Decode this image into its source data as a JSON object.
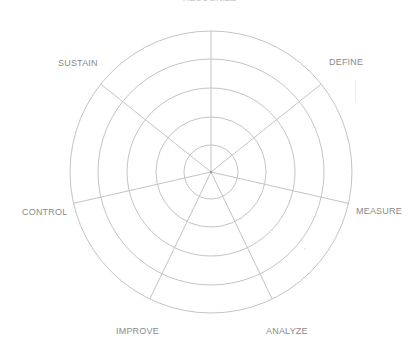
{
  "diagram": {
    "type": "radar-wheel",
    "title_clipped": "RECOGNIZE",
    "center": {
      "x": 211,
      "y": 172
    },
    "ring_radii": [
      27,
      55,
      84,
      113,
      141
    ],
    "spoke_count": 7,
    "spoke_start_angle_deg": -90,
    "colors": {
      "line": "#c4c4c4",
      "label": "#8a8a8a",
      "background": "#ffffff"
    },
    "labels": [
      {
        "id": "define",
        "text": "DEFINE",
        "x": 329,
        "y": 58
      },
      {
        "id": "measure",
        "text": "MEASURE",
        "x": 356,
        "y": 207
      },
      {
        "id": "analyze",
        "text": "ANALYZE",
        "x": 266,
        "y": 327
      },
      {
        "id": "improve",
        "text": "IMPROVE",
        "x": 116,
        "y": 327
      },
      {
        "id": "control",
        "text": "CONTROL",
        "x": 22,
        "y": 208
      },
      {
        "id": "sustain",
        "text": "SUSTAIN",
        "x": 58,
        "y": 59
      }
    ]
  }
}
